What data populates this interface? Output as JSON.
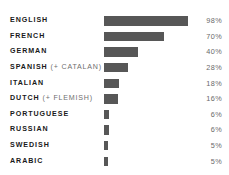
{
  "chart_data": {
    "type": "bar",
    "orientation": "horizontal",
    "title": "",
    "subtitle": "",
    "xlabel": "",
    "ylabel": "",
    "grid": false,
    "legend": null,
    "xlim": [
      0,
      98
    ],
    "categories": [
      "ENGLISH",
      "FRENCH",
      "GERMAN",
      "SPANISH (+ CATALAN)",
      "ITALIAN",
      "DUTCH (+ FLEMISH)",
      "PORTUGUESE",
      "RUSSIAN",
      "SWEDISH",
      "ARABIC"
    ],
    "values": [
      98,
      70,
      40,
      28,
      18,
      16,
      6,
      6,
      5,
      5
    ],
    "value_labels": [
      "98%",
      "70%",
      "40%",
      "28%",
      "18%",
      "16%",
      "6%",
      "6%",
      "5%",
      "5%"
    ],
    "bar_color": "#575757",
    "background_color": "#ffffff",
    "label_color": "#1a1a1a",
    "value_label_color": "#6a6a6a"
  },
  "rows": [
    {
      "main": "ENGLISH",
      "sub": "",
      "value": "98%",
      "pct": 98
    },
    {
      "main": "FRENCH",
      "sub": "",
      "value": "70%",
      "pct": 70
    },
    {
      "main": "GERMAN",
      "sub": "",
      "value": "40%",
      "pct": 40
    },
    {
      "main": "SPANISH ",
      "sub": "(+ CATALAN)",
      "value": "28%",
      "pct": 28
    },
    {
      "main": "ITALIAN",
      "sub": "",
      "value": "18%",
      "pct": 18
    },
    {
      "main": "DUTCH ",
      "sub": "(+ FLEMISH)",
      "value": "16%",
      "pct": 16
    },
    {
      "main": "PORTUGUESE",
      "sub": "",
      "value": "6%",
      "pct": 6
    },
    {
      "main": "RUSSIAN",
      "sub": "",
      "value": "6%",
      "pct": 6
    },
    {
      "main": "SWEDISH",
      "sub": "",
      "value": "5%",
      "pct": 5
    },
    {
      "main": "ARABIC",
      "sub": "",
      "value": "5%",
      "pct": 5
    }
  ]
}
